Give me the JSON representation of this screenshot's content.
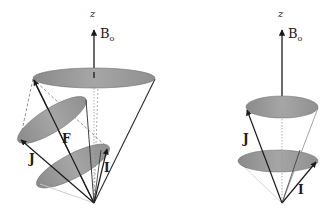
{
  "figure": {
    "colors": {
      "ellipse_fill": "#9a9a9a",
      "line": "#2a2a2a",
      "dashed": "#888888",
      "light_line": "#c8c8c8",
      "background": "#ffffff"
    },
    "left_diagram": {
      "axis_label": "z",
      "field_label": "B",
      "field_subscript": "o",
      "vector_labels": {
        "J": "J",
        "F": "F",
        "I": "I"
      }
    },
    "right_diagram": {
      "axis_label": "z",
      "field_label": "B",
      "field_subscript": "o",
      "vector_labels": {
        "J": "J",
        "I": "I"
      }
    }
  }
}
